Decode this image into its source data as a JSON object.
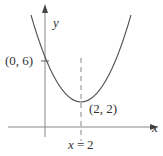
{
  "diagram": {
    "type": "parabola-graph",
    "equation": "y = (x - 2)^2 + 2",
    "axes": {
      "x_label": "x",
      "y_label": "y"
    },
    "points": [
      {
        "label": "(0, 6)",
        "x": 0,
        "y": 6
      },
      {
        "label": "(2, 2)",
        "x": 2,
        "y": 2
      }
    ],
    "axis_of_symmetry": {
      "label_var": "x",
      "label_eq": "=",
      "label_val": "2"
    },
    "colors": {
      "curve": "#555555",
      "axis": "#777777",
      "text": "#333333"
    }
  }
}
